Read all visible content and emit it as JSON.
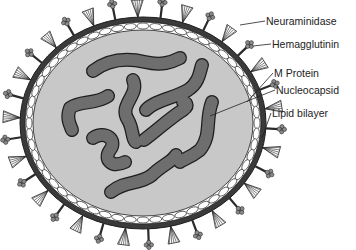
{
  "diagram": {
    "colors": {
      "background": "#ffffff",
      "envelope": "#3a3a3a",
      "interior": "#c8c8c8",
      "nucleocapsid": "#6e6e6e",
      "outline": "#1e1e1e",
      "matrix_beads": "#ffffff"
    },
    "labels": [
      {
        "id": "neuraminidase",
        "text": "Neuraminidase",
        "x": 266,
        "y": 15
      },
      {
        "id": "hemagglutinin",
        "text": "Hemagglutinin",
        "x": 272,
        "y": 38
      },
      {
        "id": "m-protein",
        "text": "M Protein",
        "x": 274,
        "y": 67
      },
      {
        "id": "nucleocapsid",
        "text": "Nucleocapsid",
        "x": 276,
        "y": 84
      },
      {
        "id": "lipid-bilayer",
        "text": "Lipid bilayer",
        "x": 272,
        "y": 107
      }
    ]
  }
}
